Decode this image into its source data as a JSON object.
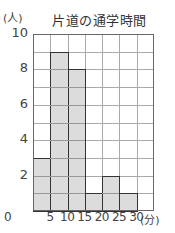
{
  "chart_data": {
    "type": "bar",
    "title": "片道の通学時間",
    "xlabel": "(分)",
    "ylabel": "(人)",
    "categories": [
      "0-5",
      "5-10",
      "10-15",
      "15-20",
      "20-25",
      "25-30",
      "30-35"
    ],
    "bin_edges": [
      0,
      5,
      10,
      15,
      20,
      25,
      30,
      35
    ],
    "values": [
      3,
      9,
      8,
      1,
      2,
      1,
      0
    ],
    "x_tick_labels": [
      "0",
      "5",
      "10",
      "15",
      "20",
      "25",
      "30"
    ],
    "y_tick_labels": [
      "10",
      "8",
      "6",
      "4",
      "2"
    ],
    "ylim": [
      0,
      10
    ],
    "xlim": [
      0,
      35
    ],
    "grid": true,
    "histogram": true
  },
  "labels": {
    "title": "片道の通学時間",
    "y_unit": "(人)",
    "x_unit": "(分)"
  },
  "colors": {
    "bar_fill": "#dcdcdc",
    "bar_edge": "#333333",
    "grid": "#aaaaaa"
  }
}
